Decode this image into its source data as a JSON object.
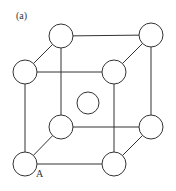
{
  "diagram": {
    "panel_label": "(a)",
    "corner_label": "A",
    "colors": {
      "line": "#333333",
      "fill": "#ffffff",
      "background": "#ffffff"
    },
    "atoms": [
      {
        "id": "back-top-left",
        "cx": 61,
        "cy": 36,
        "r": 12
      },
      {
        "id": "back-top-right",
        "cx": 151,
        "cy": 35,
        "r": 12
      },
      {
        "id": "front-top-left",
        "cx": 25,
        "cy": 72,
        "r": 12
      },
      {
        "id": "front-top-right",
        "cx": 114,
        "cy": 72,
        "r": 12
      },
      {
        "id": "body-center",
        "cx": 88,
        "cy": 103,
        "r": 11
      },
      {
        "id": "back-bottom-left",
        "cx": 61,
        "cy": 127,
        "r": 12
      },
      {
        "id": "back-bottom-right",
        "cx": 151,
        "cy": 127,
        "r": 12
      },
      {
        "id": "front-bottom-left",
        "cx": 25,
        "cy": 164,
        "r": 12
      },
      {
        "id": "front-bottom-right",
        "cx": 114,
        "cy": 164,
        "r": 12
      }
    ]
  }
}
